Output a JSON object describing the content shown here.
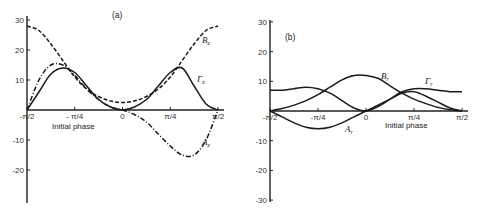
{
  "chart_data": [
    {
      "type": "line",
      "panel_label": "(a)",
      "xlabel": "Initial phase",
      "ylabel": "",
      "xlim": [
        -1.5708,
        1.5708
      ],
      "ylim": [
        -30,
        30
      ],
      "x_ticks": [
        "-π/2",
        "- π/4",
        "0",
        "π/4",
        "π/2"
      ],
      "y_ticks": [
        "30",
        "20",
        "10",
        "-10",
        "-20"
      ],
      "grid": false,
      "x": [
        -1.5708,
        -1.3744,
        -1.1781,
        -0.9817,
        -0.7854,
        -0.589,
        -0.3927,
        -0.1963,
        0,
        0.1963,
        0.3927,
        0.589,
        0.7854,
        0.9817,
        1.1781,
        1.3744,
        1.5708
      ],
      "series": [
        {
          "name": "B_z",
          "label": "Bz",
          "style": "dashed",
          "values": [
            28,
            26.5,
            22,
            16.5,
            11,
            7,
            4.5,
            3,
            2.5,
            3,
            4.5,
            7,
            11,
            16.5,
            22,
            26.5,
            28
          ]
        },
        {
          "name": "Γ_z",
          "label": "Γz",
          "style": "solid",
          "values": [
            0,
            6,
            12,
            14,
            12.5,
            8,
            3.5,
            1,
            0,
            1,
            3.5,
            8,
            12.5,
            14,
            8,
            2,
            0
          ]
        },
        {
          "name": "A_z",
          "label": "Az",
          "style": "dash-dot",
          "values": [
            0,
            10,
            15,
            15,
            11.5,
            7,
            3.5,
            1,
            0,
            -1.5,
            -4,
            -8,
            -12,
            -15,
            -15,
            -10,
            0
          ]
        }
      ]
    },
    {
      "type": "line",
      "panel_label": "(b)",
      "xlabel": "Initial phase",
      "ylabel": "",
      "xlim": [
        -1.5708,
        1.5708
      ],
      "ylim": [
        -30,
        30
      ],
      "x_ticks": [
        "-π/2",
        "-π/4",
        "0",
        "π/4",
        "π/2"
      ],
      "y_ticks": [
        "30",
        "20",
        "10",
        "-10",
        "-20",
        "-30"
      ],
      "grid": false,
      "x": [
        -1.5708,
        -1.3744,
        -1.1781,
        -0.9817,
        -0.7854,
        -0.589,
        -0.3927,
        -0.1963,
        0,
        0.1963,
        0.3927,
        0.589,
        0.7854,
        0.9817,
        1.1781,
        1.3744,
        1.5708
      ],
      "series": [
        {
          "name": "B_r",
          "label": "Br",
          "style": "solid",
          "values": [
            0,
            0.8,
            2,
            3.5,
            5.5,
            8,
            10.5,
            12,
            12,
            11,
            8.5,
            6,
            4,
            2.5,
            1.2,
            0.4,
            0
          ]
        },
        {
          "name": "Γ_r",
          "label": "Γr",
          "style": "solid",
          "values": [
            7,
            7,
            7.5,
            8,
            7.5,
            6,
            3.5,
            1,
            0,
            1.5,
            4,
            6.5,
            7.5,
            7.5,
            7,
            6.5,
            6.5
          ]
        },
        {
          "name": "A_r",
          "label": "Ar",
          "style": "solid",
          "values": [
            0,
            -2,
            -4,
            -5.5,
            -6,
            -5.5,
            -4,
            -2,
            0,
            2,
            4,
            6,
            6.5,
            5,
            3,
            1,
            0
          ]
        }
      ]
    }
  ]
}
